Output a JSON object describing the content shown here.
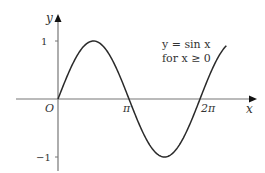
{
  "chart_data": {
    "type": "line",
    "title": "",
    "annotation": [
      "y = sin x",
      "for x ≥ 0"
    ],
    "xlabel": "x",
    "ylabel": "y",
    "origin_label": "O",
    "x_ticks": [
      {
        "value": 3.14159,
        "label": "π"
      },
      {
        "value": 6.28319,
        "label": "2π"
      }
    ],
    "y_ticks": [
      {
        "value": 1,
        "label": "1"
      },
      {
        "value": -1,
        "label": "−1"
      }
    ],
    "xlim": [
      0,
      7.45
    ],
    "ylim": [
      -1,
      1
    ],
    "series": [
      {
        "name": "y = sin x",
        "function": "sin(x)",
        "domain": [
          0,
          7.45
        ],
        "color": "#2a2a2a"
      }
    ],
    "grid": false,
    "legend": "none"
  },
  "colors": {
    "axis": "#777777",
    "curve": "#2a2a2a",
    "text": "#333333"
  }
}
